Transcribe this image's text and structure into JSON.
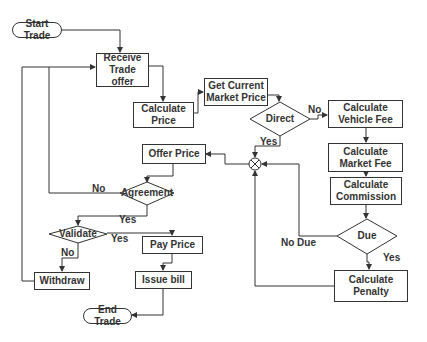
{
  "diagram": {
    "type": "flowchart",
    "nodes": {
      "start": "Start Trade",
      "receive": "Receive\nTrade offer",
      "calc_price": "Calculate\nPrice",
      "market_price": "Get Current\nMarket Price",
      "direct": "Direct",
      "vehicle_fee": "Calculate\nVehicle Fee",
      "market_fee": "Calculate\nMarket Fee",
      "commission": "Calculate\nCommission",
      "due": "Due",
      "penalty": "Calculate\nPenalty",
      "offer_price": "Offer Price",
      "agreement": "Agreement",
      "validate": "Validate",
      "pay_price": "Pay Price",
      "withdraw": "Withdraw",
      "issue_bill": "Issue bill",
      "end": "End Trade"
    },
    "edge_labels": {
      "direct_no": "No",
      "direct_yes": "Yes",
      "agreement_no": "No",
      "agreement_yes": "Yes",
      "validate_yes": "Yes",
      "validate_no": "No",
      "due_no": "No Due",
      "due_yes": "Yes"
    },
    "junction": "summing-junction"
  }
}
